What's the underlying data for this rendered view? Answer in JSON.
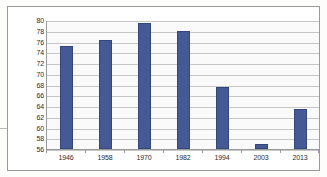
{
  "chart_data": {
    "type": "bar",
    "title": "",
    "subtitle": "",
    "xlabel": "",
    "ylabel": "",
    "categories": [
      "1946",
      "1958",
      "1970",
      "1982",
      "1994",
      "2003",
      "2013"
    ],
    "values": [
      75.2,
      76.3,
      79.4,
      77.9,
      67.5,
      57.0,
      63.5
    ],
    "series": [
      {
        "name": "",
        "values": [
          75.2,
          76.3,
          79.4,
          77.9,
          67.5,
          57.0,
          63.5
        ]
      }
    ],
    "ylim": [
      56,
      80
    ],
    "ytick_step": 2,
    "yticks": [
      80,
      78,
      76,
      74,
      72,
      70,
      68,
      66,
      64,
      62,
      60,
      58,
      56
    ],
    "grid": true,
    "grid_axis": "y",
    "legend": false,
    "legend_position": "none",
    "bar_color": "#455a94",
    "bar_edge_color": "#33477d",
    "plot_background": "#fafafa",
    "gridline_color": "#c6c6c6",
    "axis_color": "#9a9a9a",
    "frame": true
  }
}
